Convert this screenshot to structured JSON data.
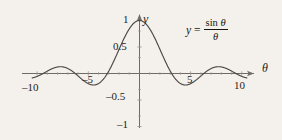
{
  "figure": {
    "name": "sinc-function-plot",
    "background_color": "#f4f1ec",
    "curve_color": "#4a4744",
    "axis_color": "#6f6b66"
  },
  "annotation": {
    "lhs": "y",
    "equals": "=",
    "numerator_fn": "sin",
    "numerator_var": "θ",
    "denominator_var": "θ",
    "full_text": "y = sin θ / θ"
  },
  "axes": {
    "x_label": "θ",
    "y_label": "y",
    "x_ticks": [
      {
        "value": -10,
        "label": "–10"
      },
      {
        "value": -5,
        "label": "–5"
      },
      {
        "value": 5,
        "label": "5"
      },
      {
        "value": 10,
        "label": "10"
      }
    ],
    "y_ticks": [
      {
        "value": 1,
        "label": "1"
      },
      {
        "value": 0.5,
        "label": "0.5"
      },
      {
        "value": -0.5,
        "label": "–0.5"
      },
      {
        "value": -1,
        "label": "–1"
      }
    ],
    "xlim": [
      -10.8,
      10.8
    ],
    "ylim": [
      -1.15,
      1.15
    ]
  },
  "chart_data": {
    "type": "line",
    "title": "",
    "subtitle": "",
    "xlabel": "θ",
    "ylabel": "y",
    "xlim": [
      -10.8,
      10.8
    ],
    "ylim": [
      -1.15,
      1.15
    ],
    "grid": false,
    "legend": null,
    "annotations": [
      {
        "text": "y = sin θ / θ",
        "x": 7.5,
        "y": 0.85
      }
    ],
    "x_tick_labels": [
      "–10",
      "–5",
      "5",
      "10"
    ],
    "x_tick_values": [
      -10,
      -5,
      5,
      10
    ],
    "y_tick_labels": [
      "1",
      "0.5",
      "–0.5",
      "–1"
    ],
    "y_tick_values": [
      1,
      0.5,
      -0.5,
      -1
    ],
    "series": [
      {
        "name": "sin(theta)/theta",
        "formula": "y = sin(theta)/theta",
        "color": "#4a4744",
        "x": [
          -10.5,
          -10.0,
          -9.5,
          -9.0,
          -8.5,
          -8.0,
          -7.5,
          -7.0,
          -6.5,
          -6.0,
          -5.5,
          -5.0,
          -4.5,
          -4.0,
          -3.5,
          -3.0,
          -2.5,
          -2.0,
          -1.5,
          -1.0,
          -0.5,
          0.0,
          0.5,
          1.0,
          1.5,
          2.0,
          2.5,
          3.0,
          3.5,
          4.0,
          4.5,
          5.0,
          5.5,
          6.0,
          6.5,
          7.0,
          7.5,
          8.0,
          8.5,
          9.0,
          9.5,
          10.0,
          10.5
        ],
        "y": [
          -0.0841,
          0.0544,
          0.0791,
          0.0458,
          -0.0093,
          -0.0624,
          -0.1253,
          -0.0939,
          -0.0334,
          0.0466,
          0.1281,
          0.1918,
          0.2172,
          0.1892,
          0.1002,
          -0.047,
          -0.2394,
          -0.4546,
          -0.665,
          -0.8415,
          -0.9589,
          1.0,
          -0.9589,
          0.8415,
          0.665,
          0.4546,
          0.2394,
          0.047,
          -0.1002,
          -0.1892,
          -0.2172,
          -0.1918,
          -0.1281,
          -0.0466,
          0.0334,
          0.0939,
          0.1253,
          0.0624,
          0.0093,
          -0.0458,
          -0.0791,
          -0.0544,
          0.0841
        ],
        "key_points": [
          {
            "label": "global maximum",
            "x": 0,
            "y": 1.0
          },
          {
            "label": "first zero right",
            "x": 3.1416,
            "y": 0
          },
          {
            "label": "first minimum right",
            "x": 4.493,
            "y": -0.2172
          },
          {
            "label": "second zero right",
            "x": 6.2832,
            "y": 0
          },
          {
            "label": "second maximum right",
            "x": 7.725,
            "y": 0.1284
          },
          {
            "label": "third zero right",
            "x": 9.4248,
            "y": 0
          },
          {
            "label": "first zero left",
            "x": -3.1416,
            "y": 0
          },
          {
            "label": "first minimum left",
            "x": -4.493,
            "y": -0.2172
          },
          {
            "label": "second zero left",
            "x": -6.2832,
            "y": 0
          },
          {
            "label": "second maximum left",
            "x": -7.725,
            "y": 0.1284
          },
          {
            "label": "third zero left",
            "x": -9.4248,
            "y": 0
          }
        ]
      }
    ]
  }
}
